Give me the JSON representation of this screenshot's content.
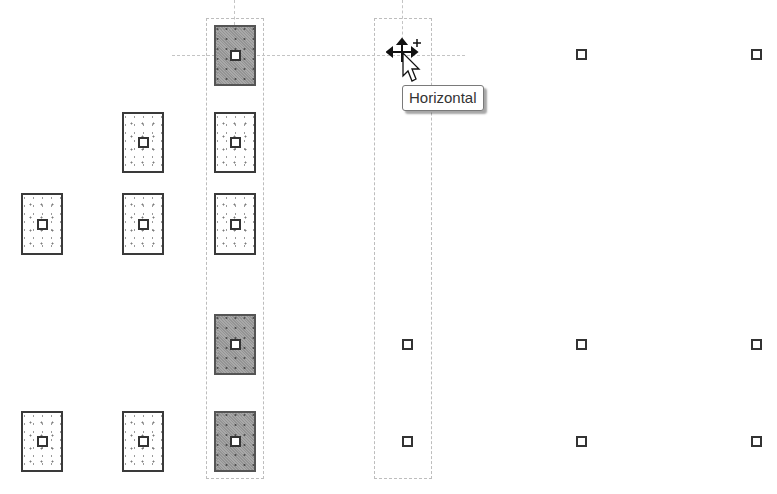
{
  "tooltip": {
    "text": "Horizontal"
  },
  "colors": {
    "background": "#ffffff",
    "footing_border": "#3a3a3a",
    "footing_selected_fill": "#a9a9a9",
    "guide_dashed": "#c4c4c4"
  },
  "cursor": {
    "type": "move-with-plus",
    "x": 402,
    "y": 55
  },
  "footings": [
    {
      "id": "r2c2",
      "x": 122,
      "y": 112,
      "selected": false
    },
    {
      "id": "r2c3",
      "x": 214,
      "y": 112,
      "selected": false
    },
    {
      "id": "r3c1",
      "x": 21,
      "y": 193,
      "selected": false
    },
    {
      "id": "r3c2",
      "x": 122,
      "y": 193,
      "selected": false
    },
    {
      "id": "r3c3",
      "x": 214,
      "y": 193,
      "selected": false
    },
    {
      "id": "r1c3",
      "x": 214,
      "y": 25,
      "selected": true
    },
    {
      "id": "r4c3",
      "x": 214,
      "y": 314,
      "selected": true
    },
    {
      "id": "r5c1",
      "x": 21,
      "y": 411,
      "selected": false
    },
    {
      "id": "r5c2",
      "x": 122,
      "y": 411,
      "selected": false
    },
    {
      "id": "r5c3",
      "x": 214,
      "y": 411,
      "selected": true
    }
  ],
  "columns": [
    {
      "x": 576,
      "y": 49
    },
    {
      "x": 751,
      "y": 49
    },
    {
      "x": 402,
      "y": 339
    },
    {
      "x": 576,
      "y": 339
    },
    {
      "x": 751,
      "y": 339
    },
    {
      "x": 402,
      "y": 436
    },
    {
      "x": 576,
      "y": 436
    },
    {
      "x": 751,
      "y": 436
    }
  ]
}
